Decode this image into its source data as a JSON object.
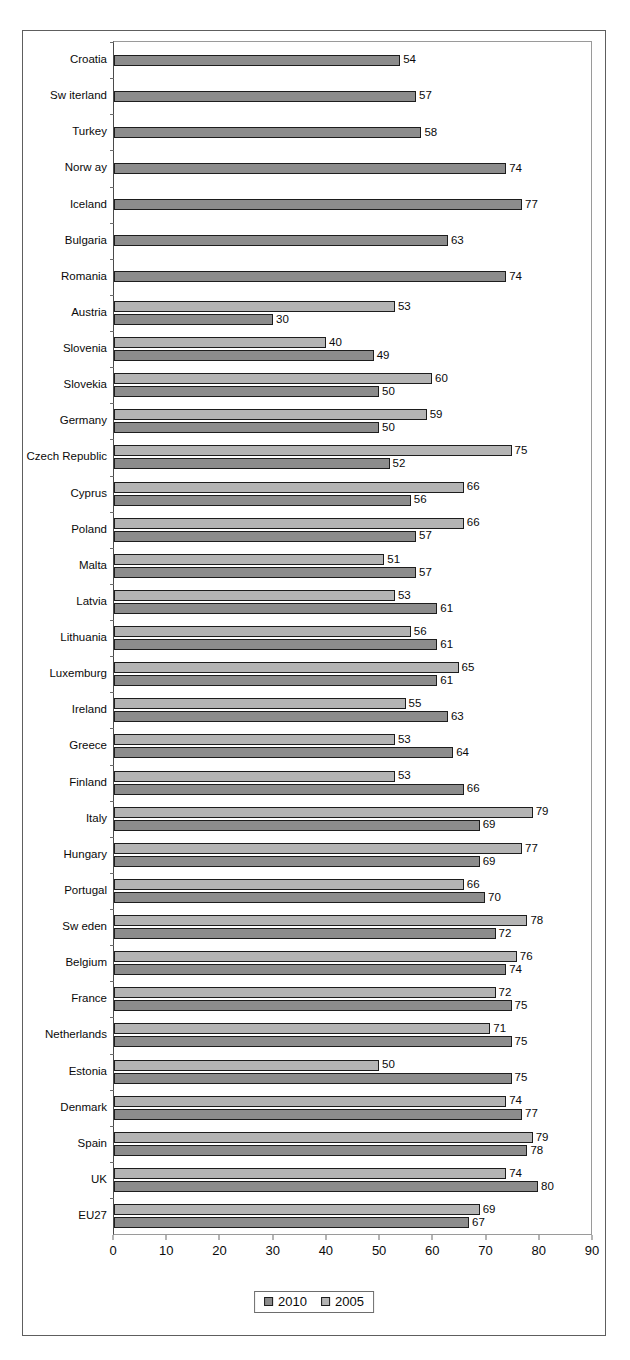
{
  "chart_data": {
    "type": "bar",
    "orientation": "horizontal",
    "title": "",
    "subtitle": "",
    "xlabel": "",
    "ylabel": "",
    "xlim": [
      0,
      90
    ],
    "xticks": [
      0,
      10,
      20,
      30,
      40,
      50,
      60,
      70,
      80,
      90
    ],
    "grid": false,
    "legend_position": "bottom-center",
    "legend": [
      "2010",
      "2005"
    ],
    "colors": {
      "2010": "#8c8c8c",
      "2005": "#b4b4b4",
      "bar_outline": "#1d1d1d",
      "axis": "#6b6b6b",
      "text": "#0a0a0a",
      "frame": "#5e5e5e"
    },
    "categories": [
      "Croatia",
      "Sw iterland",
      "Turkey",
      "Norw ay",
      "Iceland",
      "Bulgaria",
      "Romania",
      "Austria",
      "Slovenia",
      "Slovekia",
      "Germany",
      "Czech Republic",
      "Cyprus",
      "Poland",
      "Malta",
      "Latvia",
      "Lithuania",
      "Luxemburg",
      "Ireland",
      "Greece",
      "Finland",
      "Italy",
      "Hungary",
      "Portugal",
      "Sw eden",
      "Belgium",
      "France",
      "Netherlands",
      "Estonia",
      "Denmark",
      "Spain",
      "UK",
      "EU27"
    ],
    "series": [
      {
        "name": "2005",
        "values": [
          null,
          null,
          null,
          null,
          null,
          null,
          null,
          53,
          40,
          60,
          59,
          75,
          66,
          66,
          51,
          53,
          56,
          65,
          55,
          53,
          53,
          79,
          77,
          66,
          78,
          76,
          72,
          71,
          50,
          74,
          79,
          74,
          69
        ]
      },
      {
        "name": "2010",
        "values": [
          54,
          57,
          58,
          74,
          77,
          63,
          74,
          30,
          49,
          50,
          50,
          52,
          56,
          57,
          57,
          61,
          61,
          61,
          63,
          64,
          66,
          69,
          69,
          70,
          72,
          74,
          75,
          75,
          75,
          77,
          78,
          80,
          67
        ]
      }
    ],
    "rows": [
      {
        "label": "Croatia",
        "v2005": null,
        "v2010": 54
      },
      {
        "label": "Sw iterland",
        "v2005": null,
        "v2010": 57
      },
      {
        "label": "Turkey",
        "v2005": null,
        "v2010": 58
      },
      {
        "label": "Norw ay",
        "v2005": null,
        "v2010": 74
      },
      {
        "label": "Iceland",
        "v2005": null,
        "v2010": 77
      },
      {
        "label": "Bulgaria",
        "v2005": null,
        "v2010": 63
      },
      {
        "label": "Romania",
        "v2005": null,
        "v2010": 74
      },
      {
        "label": "Austria",
        "v2005": 53,
        "v2010": 30
      },
      {
        "label": "Slovenia",
        "v2005": 40,
        "v2010": 49
      },
      {
        "label": "Slovekia",
        "v2005": 60,
        "v2010": 50
      },
      {
        "label": "Germany",
        "v2005": 59,
        "v2010": 50
      },
      {
        "label": "Czech Republic",
        "v2005": 75,
        "v2010": 52
      },
      {
        "label": "Cyprus",
        "v2005": 66,
        "v2010": 56
      },
      {
        "label": "Poland",
        "v2005": 66,
        "v2010": 57
      },
      {
        "label": "Malta",
        "v2005": 51,
        "v2010": 57
      },
      {
        "label": "Latvia",
        "v2005": 53,
        "v2010": 61
      },
      {
        "label": "Lithuania",
        "v2005": 56,
        "v2010": 61
      },
      {
        "label": "Luxemburg",
        "v2005": 65,
        "v2010": 61
      },
      {
        "label": "Ireland",
        "v2005": 55,
        "v2010": 63
      },
      {
        "label": "Greece",
        "v2005": 53,
        "v2010": 64
      },
      {
        "label": "Finland",
        "v2005": 53,
        "v2010": 66
      },
      {
        "label": "Italy",
        "v2005": 79,
        "v2010": 69
      },
      {
        "label": "Hungary",
        "v2005": 77,
        "v2010": 69
      },
      {
        "label": "Portugal",
        "v2005": 66,
        "v2010": 70
      },
      {
        "label": "Sw eden",
        "v2005": 78,
        "v2010": 72
      },
      {
        "label": "Belgium",
        "v2005": 76,
        "v2010": 74
      },
      {
        "label": "France",
        "v2005": 72,
        "v2010": 75
      },
      {
        "label": "Netherlands",
        "v2005": 71,
        "v2010": 75
      },
      {
        "label": "Estonia",
        "v2005": 50,
        "v2010": 75
      },
      {
        "label": "Denmark",
        "v2005": 74,
        "v2010": 77
      },
      {
        "label": "Spain",
        "v2005": 79,
        "v2010": 78
      },
      {
        "label": "UK",
        "v2005": 74,
        "v2010": 80
      },
      {
        "label": "EU27",
        "v2005": 69,
        "v2010": 67
      }
    ]
  }
}
